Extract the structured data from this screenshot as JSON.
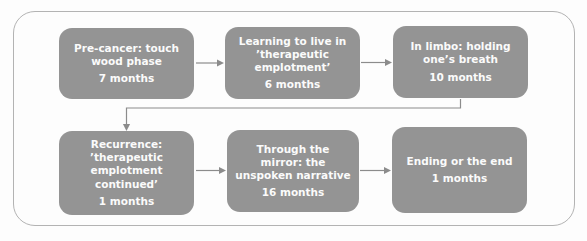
{
  "diagram": {
    "type": "flowchart",
    "boxes": [
      {
        "label": "Pre-cancer: touch wood phase",
        "duration": "7 months"
      },
      {
        "label": "Learning to live in ’therapeutic emplotment’",
        "duration": "6 months"
      },
      {
        "label": "In limbo: holding one’s breath",
        "duration": "10 months"
      },
      {
        "label": "Recurrence: ’therapeutic emplotment continued’",
        "duration": "1 months"
      },
      {
        "label": "Through the mirror: the unspoken narrative",
        "duration": "16 months"
      },
      {
        "label": "Ending or the end",
        "duration": "1 months"
      }
    ],
    "connections": [
      {
        "from": 1,
        "to": 2
      },
      {
        "from": 2,
        "to": 3
      },
      {
        "from": 3,
        "to": 4
      },
      {
        "from": 4,
        "to": 5
      },
      {
        "from": 5,
        "to": 6
      }
    ],
    "colors": {
      "box_fill": "#949494",
      "box_text": "#fbfbfb",
      "arrow": "#8c8c8c",
      "frame_border": "#b3b3b3",
      "background": "#fdfdfd"
    }
  }
}
